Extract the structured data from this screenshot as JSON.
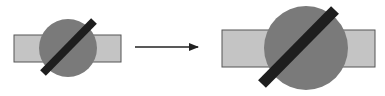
{
  "diagram": {
    "colors": {
      "rectangle_fill": "#c4c4c4",
      "rectangle_stroke": "#555555",
      "circle_fill": "#7a7a7a",
      "bar_fill": "#1e1e1e",
      "arrow": "#222222",
      "background": "#ffffff"
    },
    "before": {
      "label": "",
      "parts": [
        "rectangle",
        "circle",
        "diagonal-bar"
      ]
    },
    "arrow": {
      "label": "",
      "direction": "right"
    },
    "after": {
      "label": "",
      "parts": [
        "rectangle",
        "circle",
        "diagonal-bar"
      ]
    }
  }
}
